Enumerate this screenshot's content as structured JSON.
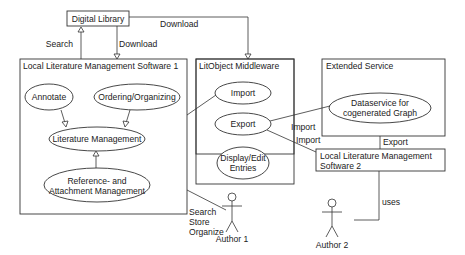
{
  "diagram": {
    "type": "uml-use-case",
    "nodes": {
      "digital_library": {
        "label": "Digital Library"
      },
      "lms1": {
        "label": "Local Literature Management Software 1",
        "use_cases": {
          "annotate": "Annotate",
          "ordering": "Ordering/Organizing",
          "lit_mgmt": "Literature Management",
          "ref_line1": "Reference- and",
          "ref_line2": "Attachment Management"
        }
      },
      "litobject": {
        "label": "LitObject Middleware",
        "use_cases": {
          "import": "Import",
          "export": "Export",
          "display_line1": "Display/Edit",
          "display_line2": "Entries"
        }
      },
      "extended": {
        "label": "Extended Service",
        "use_cases": {
          "ds_line1": "Dataservice for",
          "ds_line2": "cogenerated Graph"
        }
      },
      "lms2": {
        "label_line1": "Local Literature Management",
        "label_line2": "Software 2"
      },
      "author1": {
        "label": "Author 1"
      },
      "author2": {
        "label": "Author 2"
      }
    },
    "edge_labels": {
      "search": "Search",
      "download_left": "Download",
      "download_top": "Download",
      "import_ext": "Import",
      "import_lms2": "Import",
      "export_ext": "Export",
      "uses": "uses",
      "author1_line1": "Search",
      "author1_line2": "Store",
      "author1_line3": "Organize"
    }
  }
}
